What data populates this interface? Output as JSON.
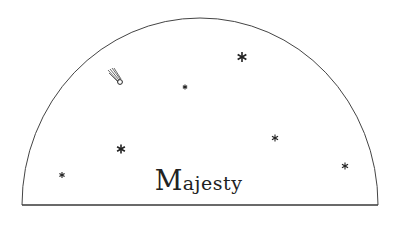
{
  "logo": {
    "text_initial": "M",
    "text_rest": "ajesty",
    "stroke_color": "#444444",
    "text_color": "#222222"
  },
  "stars": [
    {
      "x": 242,
      "y": 57,
      "size": 5
    },
    {
      "x": 185,
      "y": 87,
      "size": 2.5
    },
    {
      "x": 121,
      "y": 149,
      "size": 4.5
    },
    {
      "x": 62,
      "y": 175,
      "size": 3
    },
    {
      "x": 275,
      "y": 138,
      "size": 3.5
    },
    {
      "x": 345,
      "y": 166,
      "size": 3.5
    }
  ]
}
